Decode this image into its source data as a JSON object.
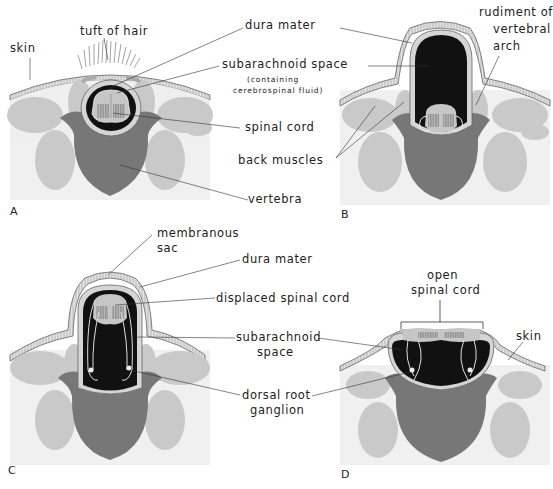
{
  "figure": {
    "panels": [
      {
        "id": "A",
        "letter": "A",
        "labels": {
          "skin": "skin",
          "tuft_of_hair": "tuft of hair",
          "dura_mater": "dura mater",
          "subarachnoid_space": "subarachnoid space",
          "subarachnoid_note_1": "(containing",
          "subarachnoid_note_2": "cerebrospinal fluid)",
          "spinal_cord": "spinal cord",
          "back_muscles": "back muscles",
          "vertebra": "vertebra"
        }
      },
      {
        "id": "B",
        "letter": "B",
        "labels": {
          "rudiment_1": "rudiment of",
          "rudiment_2": "vertebral",
          "rudiment_3": "arch"
        }
      },
      {
        "id": "C",
        "letter": "C",
        "labels": {
          "membranous_sac_1": "membranous",
          "membranous_sac_2": "sac",
          "dura_mater": "dura mater",
          "displaced_spinal_cord": "displaced spinal cord",
          "subarachnoid_1": "subarachnoid",
          "subarachnoid_2": "space",
          "dorsal_root_1": "dorsal root",
          "dorsal_root_2": "ganglion"
        }
      },
      {
        "id": "D",
        "letter": "D",
        "labels": {
          "open_spinal_cord_1": "open",
          "open_spinal_cord_2": "spinal cord",
          "skin": "skin"
        }
      }
    ],
    "colors": {
      "background_tissue": "#f2f2f2",
      "muscle": "#c8c8c8",
      "vertebra": "#777777",
      "csf_space": "#111111",
      "skin": "#d9d9d9",
      "cord": "#bdbdbd",
      "line": "#333333"
    }
  }
}
